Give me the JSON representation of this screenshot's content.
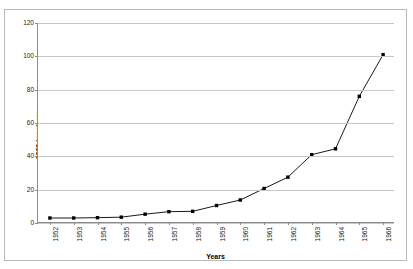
{
  "chart_data": {
    "type": "line",
    "title": "",
    "xlabel": "Years",
    "ylabel": "1000 tons/year",
    "categories": [
      "1952",
      "1953",
      "1954",
      "1955",
      "1956",
      "1957",
      "1958",
      "1959",
      "1960",
      "1961",
      "1962",
      "1963",
      "1964",
      "1965",
      "1966"
    ],
    "values": [
      3.0,
      3.0,
      3.2,
      3.5,
      5.3,
      6.8,
      7.0,
      10.5,
      13.8,
      20.7,
      27.5,
      41.0,
      44.5,
      76.0,
      101.0
    ],
    "series": [
      {
        "name": "Production",
        "values": [
          3.0,
          3.0,
          3.2,
          3.5,
          5.3,
          6.8,
          7.0,
          10.5,
          13.8,
          20.7,
          27.5,
          41.0,
          44.5,
          76.0,
          101.0
        ]
      }
    ],
    "ylim": [
      0,
      120
    ],
    "yticks": [
      0,
      20,
      40,
      60,
      80,
      100,
      120
    ],
    "ytick_labels": [
      "0",
      "20",
      "40",
      "60",
      "80",
      "100",
      "120"
    ],
    "grid": "horizontal",
    "legend": "none",
    "marker": "square",
    "line_color": "#000000",
    "marker_color": "#000000",
    "grid_color": "#c8c8c8",
    "axis_color": "#8c8c8c",
    "frame_color": "#b9b9b9",
    "background": "#ffffff"
  }
}
